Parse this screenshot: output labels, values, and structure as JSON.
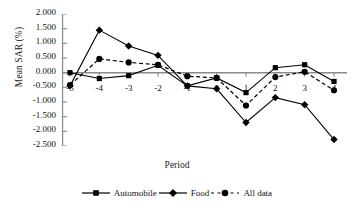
{
  "chart_data": {
    "type": "line",
    "title": "",
    "xlabel": "Period",
    "ylabel": "Mean SAR (%)",
    "categories": [
      "-5",
      "-4",
      "-3",
      "-2",
      "-1",
      "0",
      "1",
      "2",
      "3",
      "4"
    ],
    "xtick_labels": [
      "-5",
      "-4",
      "-3",
      "-2",
      "-1",
      "0",
      "1",
      "2",
      "3",
      "4"
    ],
    "ytick_labels": [
      "2.000",
      "1.500",
      "1.000",
      "0.500",
      "0.000",
      "-0.500",
      "-1.000",
      "-1.500",
      "-2.000",
      "-2.500"
    ],
    "ytick_values": [
      2.0,
      1.5,
      1.0,
      0.5,
      0.0,
      -0.5,
      -1.0,
      -1.5,
      -2.0,
      -2.5
    ],
    "ylim": [
      -2.5,
      2.0
    ],
    "grid": false,
    "legend_position": "bottom",
    "series": [
      {
        "name": "Automobile",
        "marker": "square",
        "line_style": "solid",
        "color": "#000000",
        "values": [
          0.0,
          -0.2,
          -0.1,
          0.25,
          -0.45,
          -0.18,
          -0.68,
          0.17,
          0.27,
          -0.3
        ]
      },
      {
        "name": "Food",
        "marker": "diamond",
        "line_style": "solid",
        "color": "#000000",
        "values": [
          -0.45,
          1.45,
          0.91,
          0.59,
          -0.45,
          -0.55,
          -1.7,
          -0.85,
          -1.09,
          -2.28
        ]
      },
      {
        "name": "All data",
        "marker": "circle",
        "line_style": "dashed",
        "color": "#000000",
        "values": [
          -0.42,
          0.47,
          0.35,
          0.27,
          -0.12,
          -0.18,
          -1.12,
          -0.15,
          0.03,
          -0.6
        ]
      }
    ]
  },
  "legend": {
    "items": [
      {
        "label": "Automobile",
        "marker": "square",
        "line_style": "solid"
      },
      {
        "label": "Food",
        "marker": "diamond",
        "line_style": "solid"
      },
      {
        "label": "All data",
        "marker": "circle",
        "line_style": "dashed"
      }
    ]
  },
  "axis": {
    "x_title": "Period",
    "y_title": "Mean SAR (%)"
  }
}
